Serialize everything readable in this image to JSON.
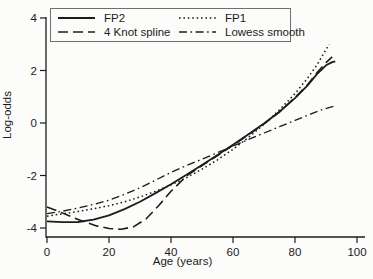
{
  "chart_data": {
    "type": "line",
    "xlabel": "Age (years)",
    "ylabel": "Log-odds",
    "xlim": [
      0,
      103
    ],
    "ylim": [
      -4.35,
      4
    ],
    "x_ticks": [
      0,
      20,
      40,
      60,
      80,
      100
    ],
    "y_ticks": [
      4,
      2,
      0,
      -2,
      -4
    ],
    "grid": false,
    "line_color": "#1c1c1c",
    "legend": {
      "position": "top-left",
      "border": true,
      "columns": 2
    },
    "series": [
      {
        "name": "FP2",
        "style": "solid",
        "points": [
          [
            0,
            -3.75
          ],
          [
            5,
            -3.78
          ],
          [
            10,
            -3.77
          ],
          [
            15,
            -3.68
          ],
          [
            20,
            -3.52
          ],
          [
            25,
            -3.28
          ],
          [
            30,
            -3.0
          ],
          [
            35,
            -2.67
          ],
          [
            40,
            -2.33
          ],
          [
            45,
            -1.97
          ],
          [
            50,
            -1.6
          ],
          [
            55,
            -1.22
          ],
          [
            60,
            -0.83
          ],
          [
            65,
            -0.43
          ],
          [
            70,
            -0.02
          ],
          [
            75,
            0.43
          ],
          [
            80,
            0.95
          ],
          [
            84,
            1.42
          ],
          [
            87,
            1.85
          ],
          [
            90,
            2.2
          ],
          [
            92,
            2.32
          ],
          [
            93,
            2.35
          ]
        ]
      },
      {
        "name": "FP1",
        "style": "dotted",
        "points": [
          [
            0,
            -3.55
          ],
          [
            5,
            -3.46
          ],
          [
            10,
            -3.37
          ],
          [
            15,
            -3.27
          ],
          [
            20,
            -3.15
          ],
          [
            25,
            -3.0
          ],
          [
            30,
            -2.82
          ],
          [
            35,
            -2.6
          ],
          [
            40,
            -2.36
          ],
          [
            45,
            -2.08
          ],
          [
            50,
            -1.76
          ],
          [
            55,
            -1.4
          ],
          [
            60,
            -1.0
          ],
          [
            65,
            -0.55
          ],
          [
            70,
            -0.05
          ],
          [
            75,
            0.5
          ],
          [
            80,
            1.12
          ],
          [
            84,
            1.7
          ],
          [
            87,
            2.2
          ],
          [
            89,
            2.6
          ],
          [
            91,
            3.0
          ]
        ]
      },
      {
        "name": "4 Knot spline",
        "style": "dashed",
        "points": [
          [
            0,
            -3.2
          ],
          [
            4,
            -3.38
          ],
          [
            8,
            -3.58
          ],
          [
            12,
            -3.76
          ],
          [
            16,
            -3.92
          ],
          [
            20,
            -4.02
          ],
          [
            24,
            -4.05
          ],
          [
            28,
            -3.95
          ],
          [
            32,
            -3.65
          ],
          [
            36,
            -3.15
          ],
          [
            40,
            -2.6
          ],
          [
            45,
            -2.02
          ],
          [
            50,
            -1.62
          ],
          [
            55,
            -1.24
          ],
          [
            60,
            -0.85
          ],
          [
            65,
            -0.45
          ],
          [
            70,
            -0.03
          ],
          [
            75,
            0.42
          ],
          [
            80,
            0.97
          ],
          [
            84,
            1.45
          ],
          [
            87,
            1.9
          ],
          [
            90,
            2.3
          ],
          [
            92,
            2.52
          ]
        ]
      },
      {
        "name": "Lowess smooth",
        "style": "dash-dot",
        "points": [
          [
            0,
            -3.45
          ],
          [
            5,
            -3.36
          ],
          [
            10,
            -3.24
          ],
          [
            15,
            -3.1
          ],
          [
            20,
            -2.94
          ],
          [
            25,
            -2.72
          ],
          [
            30,
            -2.47
          ],
          [
            35,
            -2.18
          ],
          [
            40,
            -1.88
          ],
          [
            45,
            -1.62
          ],
          [
            50,
            -1.38
          ],
          [
            55,
            -1.13
          ],
          [
            60,
            -0.88
          ],
          [
            65,
            -0.63
          ],
          [
            70,
            -0.38
          ],
          [
            75,
            -0.14
          ],
          [
            80,
            0.1
          ],
          [
            85,
            0.34
          ],
          [
            89,
            0.52
          ],
          [
            93,
            0.65
          ]
        ]
      }
    ]
  }
}
